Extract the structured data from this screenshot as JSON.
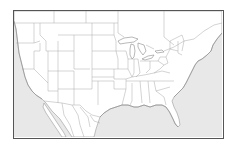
{
  "map": {
    "type": "blank outline map",
    "region": "Contiguous United States with parts of Canada and Mexico",
    "labels": [],
    "colors": {
      "land": "#ffffff",
      "water": "#e8e8e8",
      "borders": "#a8a8a8",
      "frame": "#555555"
    }
  }
}
